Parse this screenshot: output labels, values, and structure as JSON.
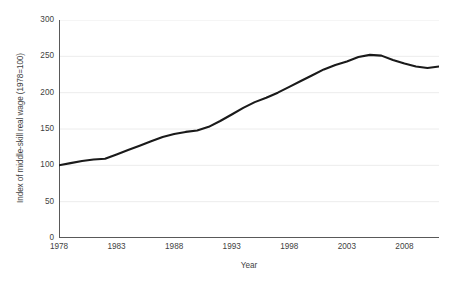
{
  "chart_data": {
    "type": "line",
    "title": "",
    "xlabel": "Year",
    "ylabel": "Index of middle-skill real wage (1978=100)",
    "xlim": [
      1978,
      2011
    ],
    "ylim": [
      0,
      300
    ],
    "grid": true,
    "legend": false,
    "line_color": "#1a1a1a",
    "axis_color": "#595959",
    "grid_color": "#ececec",
    "xticks": [
      1978,
      1983,
      1988,
      1993,
      1998,
      2003,
      2008
    ],
    "xtick_labels": [
      "1978",
      "1983",
      "1988",
      "1993",
      "1998",
      "2003",
      "2008"
    ],
    "yticks": [
      0,
      50,
      100,
      150,
      200,
      250,
      300
    ],
    "ytick_labels": [
      "0",
      "50",
      "100",
      "150",
      "200",
      "250",
      "300"
    ],
    "series": [
      {
        "name": "Index of middle-skill real wage (1978=100)",
        "x": [
          1978,
          1979,
          1980,
          1981,
          1982,
          1983,
          1984,
          1985,
          1986,
          1987,
          1988,
          1989,
          1990,
          1991,
          1992,
          1993,
          1994,
          1995,
          1996,
          1997,
          1998,
          1999,
          2000,
          2001,
          2002,
          2003,
          2004,
          2005,
          2006,
          2007,
          2008,
          2009,
          2010,
          2011
        ],
        "values": [
          100,
          103,
          106,
          108,
          109,
          115,
          121,
          127,
          133,
          139,
          143,
          146,
          148,
          153,
          161,
          170,
          179,
          187,
          193,
          200,
          208,
          216,
          224,
          232,
          238,
          243,
          249,
          252,
          251,
          245,
          240,
          236,
          234,
          236
        ]
      }
    ]
  },
  "axis": {
    "x_title": "Year",
    "y_title": "Index of middle-skill real wage (1978=100)"
  }
}
